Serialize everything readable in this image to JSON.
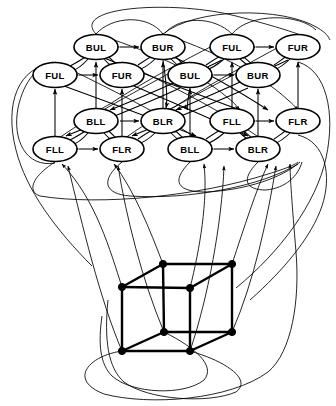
{
  "figure": {
    "node_label_legend": "Each label is a 3-letter corner code: F/B = front/back, U/L = upper/lower, L/R = left/right",
    "canvas": {
      "width": 336,
      "height": 406,
      "background": "#ffffff"
    },
    "ink_color": "#000000"
  },
  "graph": {
    "node_count": 16,
    "rows": [
      {
        "row_index": 0,
        "y": 47,
        "nodes": [
          {
            "id": "n0",
            "label": "BUL",
            "x": 96,
            "y": 47
          },
          {
            "id": "n1",
            "label": "BUR",
            "x": 163,
            "y": 47
          },
          {
            "id": "n2",
            "label": "FUL",
            "x": 232,
            "y": 47
          },
          {
            "id": "n3",
            "label": "FUR",
            "x": 298,
            "y": 47
          }
        ]
      },
      {
        "row_index": 1,
        "y": 75,
        "nodes": [
          {
            "id": "n4",
            "label": "FUL",
            "x": 55,
            "y": 75
          },
          {
            "id": "n5",
            "label": "FUR",
            "x": 122,
            "y": 75
          },
          {
            "id": "n6",
            "label": "BUL",
            "x": 190,
            "y": 75
          },
          {
            "id": "n7",
            "label": "BUR",
            "x": 258,
            "y": 75
          }
        ]
      },
      {
        "row_index": 2,
        "y": 121,
        "nodes": [
          {
            "id": "n8",
            "label": "BLL",
            "x": 96,
            "y": 121
          },
          {
            "id": "n9",
            "label": "BLR",
            "x": 163,
            "y": 121
          },
          {
            "id": "n10",
            "label": "FLL",
            "x": 232,
            "y": 121
          },
          {
            "id": "n11",
            "label": "FLR",
            "x": 298,
            "y": 121
          }
        ]
      },
      {
        "row_index": 3,
        "y": 149,
        "nodes": [
          {
            "id": "n12",
            "label": "FLL",
            "x": 55,
            "y": 149
          },
          {
            "id": "n13",
            "label": "FLR",
            "x": 122,
            "y": 149
          },
          {
            "id": "n14",
            "label": "BLL",
            "x": 190,
            "y": 149
          },
          {
            "id": "n15",
            "label": "BLR",
            "x": 258,
            "y": 149
          }
        ]
      }
    ],
    "node_shape": {
      "type": "ellipse",
      "rx": 22,
      "ry": 12.5
    }
  },
  "cube": {
    "label": "3-cube wireframe",
    "vertex_count": 8,
    "vertices": [
      {
        "id": "c_tfl",
        "name": "top-front-left",
        "x": 122,
        "y": 287
      },
      {
        "id": "c_tbl",
        "name": "top-back-left",
        "x": 163,
        "y": 264
      },
      {
        "id": "c_tbr",
        "name": "top-back-right",
        "x": 232,
        "y": 264
      },
      {
        "id": "c_tfr",
        "name": "top-front-right",
        "x": 190,
        "y": 288
      },
      {
        "id": "c_bfl",
        "name": "bottom-front-left",
        "x": 122,
        "y": 351
      },
      {
        "id": "c_bbl",
        "name": "bottom-back-left",
        "x": 164,
        "y": 332
      },
      {
        "id": "c_bbr",
        "name": "bottom-back-right",
        "x": 232,
        "y": 332
      },
      {
        "id": "c_bfr",
        "name": "bottom-front-right",
        "x": 190,
        "y": 351
      }
    ],
    "edges": [
      [
        "c_tfl",
        "c_tbl"
      ],
      [
        "c_tbl",
        "c_tbr"
      ],
      [
        "c_tbr",
        "c_tfr"
      ],
      [
        "c_tfr",
        "c_tfl"
      ],
      [
        "c_bfl",
        "c_bbl"
      ],
      [
        "c_bbl",
        "c_bbr"
      ],
      [
        "c_bbr",
        "c_bfr"
      ],
      [
        "c_bfr",
        "c_bfl"
      ],
      [
        "c_tfl",
        "c_bfl"
      ],
      [
        "c_tbl",
        "c_bbl"
      ],
      [
        "c_tbr",
        "c_bbr"
      ],
      [
        "c_tfr",
        "c_bfr"
      ]
    ]
  }
}
